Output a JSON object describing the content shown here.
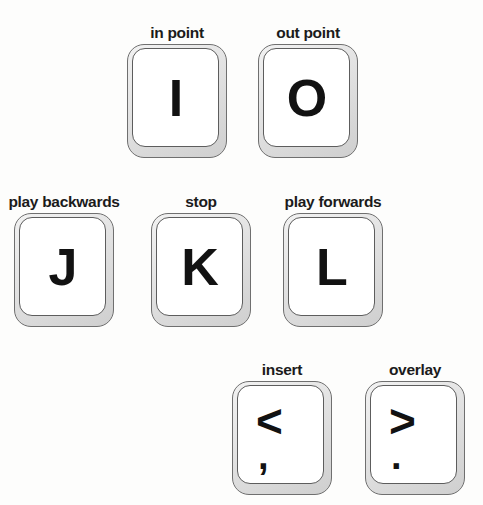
{
  "background_color": "#fdfdfc",
  "glyph_color": "#121212",
  "label_color": "#1b1b1b",
  "keycap": {
    "face_color": "#ffffff",
    "edge_color": "#cfcfcf",
    "border_color": "#6f6f6f",
    "width": 100,
    "height": 114
  },
  "rows": [
    {
      "name": "row-in-out",
      "keys": [
        {
          "id": "key-i",
          "label": "in point",
          "primary": "I",
          "secondary": "",
          "x": 127,
          "y": 44
        },
        {
          "id": "key-o",
          "label": "out point",
          "primary": "O",
          "secondary": "",
          "x": 258,
          "y": 44
        }
      ]
    },
    {
      "name": "row-jkl",
      "keys": [
        {
          "id": "key-j",
          "label": "play backwards",
          "primary": "J",
          "secondary": "",
          "x": 14,
          "y": 213
        },
        {
          "id": "key-k",
          "label": "stop",
          "primary": "K",
          "secondary": "",
          "x": 151,
          "y": 213
        },
        {
          "id": "key-l",
          "label": "play forwards",
          "primary": "L",
          "secondary": "",
          "x": 283,
          "y": 213
        }
      ]
    },
    {
      "name": "row-insert-overlay",
      "keys": [
        {
          "id": "key-comma",
          "label": "insert",
          "primary": "<",
          "secondary": ",",
          "x": 232,
          "y": 381
        },
        {
          "id": "key-period",
          "label": "overlay",
          "primary": ">",
          "secondary": ".",
          "x": 365,
          "y": 381
        }
      ]
    }
  ]
}
